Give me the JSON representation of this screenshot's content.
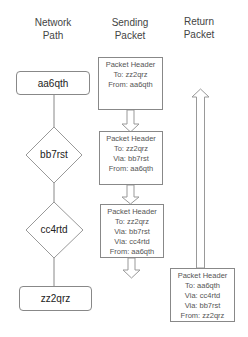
{
  "columns": {
    "network_path": [
      "Network",
      "Path"
    ],
    "sending_packet": [
      "Sending",
      "Packet"
    ],
    "return_packet": [
      "Return",
      "Packet"
    ]
  },
  "network_nodes": [
    {
      "label": "aa6qth",
      "shape": "rounded-rect"
    },
    {
      "label": "bb7rst",
      "shape": "diamond"
    },
    {
      "label": "cc4rtd",
      "shape": "diamond"
    },
    {
      "label": "zz2qrz",
      "shape": "rounded-rect"
    }
  ],
  "sending_packets": [
    {
      "lines": [
        "Packet Header",
        "To: zz2qrz",
        "From: aa6qth"
      ]
    },
    {
      "lines": [
        "Packet Header",
        "To: zz2qrz",
        "Via: bb7rst",
        "From: aa6qth"
      ]
    },
    {
      "lines": [
        "Packet Header",
        "To: zz2qrz",
        "Via: bb7rst",
        "Via: cc4rtd",
        "From: aa6qth"
      ]
    }
  ],
  "return_packet": {
    "lines": [
      "Packet Header",
      "To: aa6qth",
      "Via: cc4rtd",
      "Via: bb7rst",
      "From: zz2qrz"
    ]
  },
  "colors": {
    "stroke": "#888888",
    "text": "#333333"
  }
}
